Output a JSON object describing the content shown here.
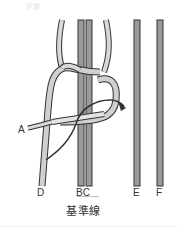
{
  "figure": {
    "caption_faint": "步驟",
    "labels": {
      "a": "A",
      "d": "D",
      "bc": "BC",
      "e": "E",
      "f": "F"
    },
    "baseline_label": "基準線",
    "colors": {
      "cord_fill": "#c8c8c8",
      "cord_outline": "#333333",
      "core_fill": "#9a9a9a",
      "arrow": "#333333"
    },
    "icons": [
      "arrow-icon",
      "brace-icon"
    ]
  }
}
